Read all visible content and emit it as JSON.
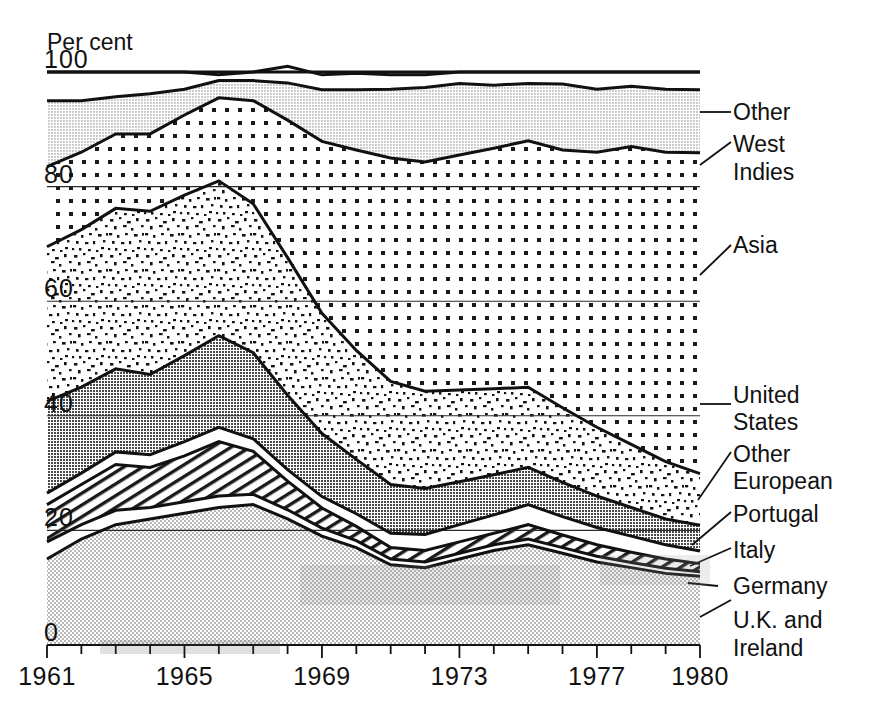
{
  "axis": {
    "unit_label": "Per cent",
    "y_ticks": [
      100,
      80,
      60,
      40,
      20,
      0
    ],
    "y_tick_labels": [
      "100",
      "80",
      "60",
      "40",
      "20",
      "0"
    ],
    "x_tick_labels": [
      "1961",
      "1965",
      "1969",
      "1973",
      "1977",
      "1980"
    ],
    "x_tick_values": [
      1961,
      1965,
      1969,
      1973,
      1977,
      1980
    ]
  },
  "labels": {
    "other": "Other",
    "west_indies_1": "West",
    "west_indies_2": "Indies",
    "asia": "Asia",
    "united_states_1": "United",
    "united_states_2": "States",
    "other_european_1": "Other",
    "other_european_2": "European",
    "portugal": "Portugal",
    "italy": "Italy",
    "germany": "Germany",
    "uk_ireland_1": "U.K. and",
    "uk_ireland_2": "Ireland"
  },
  "chart_data": {
    "type": "area",
    "stacked": true,
    "title": "",
    "subtitle": "",
    "xlabel": "",
    "ylabel": "Per cent",
    "ylim": [
      0,
      100
    ],
    "xlim": [
      1961,
      1980
    ],
    "grid": true,
    "legend_position": "right-inline-callouts",
    "x": [
      1961,
      1962,
      1963,
      1964,
      1965,
      1966,
      1967,
      1968,
      1969,
      1970,
      1971,
      1972,
      1973,
      1974,
      1975,
      1976,
      1977,
      1978,
      1979,
      1980
    ],
    "series": [
      {
        "name": "U.K. and Ireland",
        "pattern": "light-stipple",
        "color": "#d9d9d9",
        "values": [
          15.0,
          18.5,
          21.0,
          22.0,
          23.0,
          24.0,
          24.5,
          22.0,
          19.0,
          17.0,
          14.0,
          13.5,
          15.0,
          16.5,
          17.5,
          16.0,
          14.5,
          13.5,
          12.5,
          12.0
        ]
      },
      {
        "name": "Germany",
        "pattern": "white",
        "color": "#ffffff",
        "values": [
          3.0,
          2.5,
          2.5,
          2.0,
          2.0,
          2.0,
          1.8,
          1.6,
          1.4,
          1.2,
          1.0,
          1.0,
          1.0,
          1.0,
          1.0,
          1.0,
          1.0,
          0.9,
          0.9,
          0.8
        ]
      },
      {
        "name": "Italy",
        "pattern": "diagonal-hatch",
        "color": "#ffffff",
        "values": [
          6.5,
          7.0,
          8.0,
          7.0,
          8.0,
          9.5,
          7.5,
          5.0,
          3.5,
          2.5,
          2.0,
          2.0,
          2.0,
          2.0,
          2.5,
          2.2,
          2.0,
          1.8,
          1.6,
          1.4
        ]
      },
      {
        "name": "Portugal",
        "pattern": "white",
        "color": "#ffffff",
        "values": [
          2.0,
          2.0,
          2.2,
          2.2,
          2.5,
          2.5,
          2.2,
          2.0,
          2.0,
          2.2,
          2.5,
          2.8,
          3.0,
          3.2,
          3.5,
          3.2,
          3.0,
          2.8,
          2.5,
          2.2
        ]
      },
      {
        "name": "Other European",
        "pattern": "dark-crosshatch",
        "color": "#7a7a7a",
        "values": [
          16.0,
          15.0,
          14.5,
          14.0,
          15.0,
          16.0,
          15.0,
          13.0,
          11.0,
          9.5,
          8.5,
          8.0,
          7.5,
          7.0,
          6.5,
          6.0,
          5.5,
          5.0,
          4.5,
          4.5
        ]
      },
      {
        "name": "United States",
        "pattern": "coarse-speckle",
        "color": "#ffffff",
        "values": [
          27.0,
          27.5,
          28.0,
          28.5,
          28.0,
          27.0,
          26.0,
          24.0,
          21.0,
          19.0,
          18.0,
          17.0,
          16.0,
          15.0,
          14.0,
          13.0,
          12.0,
          11.0,
          10.0,
          9.0
        ]
      },
      {
        "name": "Asia",
        "pattern": "dot-grid",
        "color": "#ffffff",
        "values": [
          14.0,
          13.5,
          13.0,
          13.5,
          14.0,
          14.5,
          18.0,
          24.0,
          30.0,
          35.0,
          39.0,
          40.0,
          41.0,
          42.0,
          43.0,
          45.0,
          48.0,
          52.0,
          54.0,
          56.0
        ]
      },
      {
        "name": "West Indies",
        "pattern": "light-gray",
        "color": "#cfcfcf",
        "values": [
          11.5,
          9.0,
          6.5,
          7.0,
          4.5,
          3.0,
          3.5,
          6.5,
          9.0,
          10.5,
          12.0,
          13.0,
          12.5,
          11.0,
          10.0,
          11.5,
          11.0,
          10.5,
          11.0,
          11.0
        ]
      },
      {
        "name": "Other",
        "pattern": "white",
        "color": "#ffffff",
        "values": [
          5.0,
          5.0,
          4.3,
          3.8,
          3.0,
          1.0,
          1.5,
          2.9,
          2.6,
          2.9,
          2.5,
          2.2,
          2.0,
          2.3,
          2.0,
          2.1,
          3.0,
          2.5,
          3.0,
          3.1
        ]
      }
    ]
  }
}
